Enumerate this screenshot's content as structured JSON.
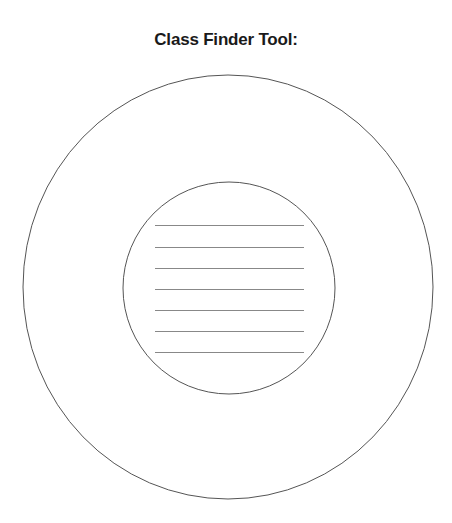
{
  "title": "Class Finder Tool:",
  "diagram": {
    "outer_circle": {
      "cx": 228,
      "cy": 287,
      "rx": 205,
      "ry": 212
    },
    "inner_circle": {
      "cx": 229,
      "cy": 288,
      "r": 106
    },
    "lines": {
      "x1": 155,
      "x2": 304,
      "ys": [
        225,
        247,
        268,
        289,
        310,
        331,
        352
      ]
    },
    "stroke_color": "#555555",
    "line_color": "#888888"
  }
}
